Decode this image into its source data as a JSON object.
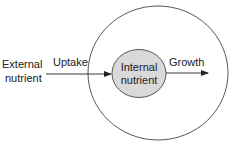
{
  "diagram": {
    "external_label_line1": "External",
    "external_label_line2": "nutrient",
    "uptake_label": "Uptake",
    "internal_label_line1": "Internal",
    "internal_label_line2": "nutrient",
    "growth_label": "Growth",
    "colors": {
      "stroke": "#222222",
      "inner_fill": "#d9d9d9",
      "background": "#ffffff"
    }
  }
}
